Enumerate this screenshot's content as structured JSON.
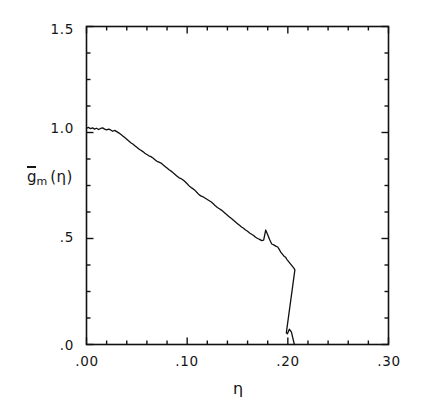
{
  "figure": {
    "background_color": "#ffffff",
    "line_color": "#111111",
    "axis_color": "#111111"
  },
  "axes": {
    "x_label": "η",
    "y_label_base": "g",
    "y_label_sub": "m",
    "y_label_arg": "(η)",
    "y_tick_labels": [
      "1.5",
      "1.0",
      ".5",
      ".0"
    ],
    "y_tick_values": [
      1.5,
      1.0,
      0.5,
      0.0
    ],
    "x_tick_labels": [
      ".00",
      ".10",
      ".20",
      ".30"
    ],
    "x_tick_values": [
      0.0,
      0.1,
      0.2,
      0.3
    ],
    "x_minor_count": 5,
    "y_minor_count": 3
  },
  "chart_data": {
    "type": "line",
    "title": "",
    "subtitle": "",
    "xlabel": "η",
    "ylabel": "ḡ_m (η)",
    "xlim": [
      0.0,
      0.3
    ],
    "ylim": [
      0.0,
      1.5
    ],
    "grid": false,
    "legend": null,
    "legend_position": "none",
    "xticks": [
      0.0,
      0.1,
      0.2,
      0.3
    ],
    "xticklabels": [
      ".00",
      ".10",
      ".20",
      ".30"
    ],
    "yticks": [
      0.0,
      0.5,
      1.0,
      1.5
    ],
    "yticklabels": [
      ".0",
      ".5",
      "1.0",
      "1.5"
    ],
    "series": [
      {
        "name": "g_m(eta)",
        "color": "#111111",
        "linewidth": 1.3,
        "x": [
          0.0,
          0.002,
          0.004,
          0.006,
          0.008,
          0.01,
          0.012,
          0.014,
          0.016,
          0.018,
          0.02,
          0.022,
          0.024,
          0.026,
          0.028,
          0.03,
          0.032,
          0.034,
          0.036,
          0.038,
          0.04,
          0.042,
          0.044,
          0.046,
          0.048,
          0.05,
          0.052,
          0.054,
          0.056,
          0.058,
          0.06,
          0.062,
          0.064,
          0.066,
          0.068,
          0.07,
          0.072,
          0.074,
          0.076,
          0.078,
          0.08,
          0.082,
          0.084,
          0.086,
          0.088,
          0.09,
          0.092,
          0.094,
          0.096,
          0.098,
          0.1,
          0.102,
          0.104,
          0.106,
          0.108,
          0.11,
          0.112,
          0.114,
          0.116,
          0.118,
          0.12,
          0.122,
          0.124,
          0.126,
          0.128,
          0.13,
          0.132,
          0.134,
          0.136,
          0.138,
          0.14,
          0.142,
          0.144,
          0.146,
          0.148,
          0.15,
          0.152,
          0.154,
          0.156,
          0.158,
          0.16,
          0.162,
          0.164,
          0.166,
          0.168,
          0.17,
          0.172,
          0.174,
          0.176,
          0.178,
          0.18,
          0.182,
          0.184,
          0.186,
          0.188,
          0.19,
          0.191,
          0.192,
          0.193,
          0.194,
          0.195,
          0.196,
          0.197,
          0.198,
          0.199,
          0.2,
          0.201,
          0.202,
          0.203,
          0.204,
          0.205,
          0.206,
          0.207
        ],
        "y": [
          1.02,
          1.024,
          1.018,
          1.022,
          1.016,
          1.02,
          1.014,
          1.019,
          1.022,
          1.016,
          1.012,
          1.016,
          1.012,
          1.006,
          1.01,
          1.004,
          0.998,
          0.992,
          0.984,
          0.976,
          0.968,
          0.96,
          0.952,
          0.946,
          0.938,
          0.93,
          0.922,
          0.916,
          0.91,
          0.902,
          0.896,
          0.89,
          0.886,
          0.88,
          0.872,
          0.864,
          0.86,
          0.856,
          0.848,
          0.84,
          0.832,
          0.824,
          0.818,
          0.81,
          0.802,
          0.794,
          0.786,
          0.782,
          0.776,
          0.768,
          0.758,
          0.748,
          0.74,
          0.734,
          0.726,
          0.716,
          0.706,
          0.7,
          0.696,
          0.69,
          0.684,
          0.678,
          0.672,
          0.664,
          0.654,
          0.646,
          0.64,
          0.634,
          0.626,
          0.618,
          0.61,
          0.602,
          0.594,
          0.586,
          0.578,
          0.57,
          0.562,
          0.554,
          0.548,
          0.54,
          0.534,
          0.526,
          0.52,
          0.514,
          0.506,
          0.5,
          0.496,
          0.49,
          0.492,
          0.54,
          0.518,
          0.494,
          0.474,
          0.47,
          0.464,
          0.46,
          0.452,
          0.444,
          0.436,
          0.43,
          0.424,
          0.418,
          0.414,
          0.41,
          0.402,
          0.396,
          0.39,
          0.384,
          0.378,
          0.372,
          0.366,
          0.36,
          0.352
        ],
        "note": "monotone decreasing noisy curve from ~1.02 at eta=0 to ~0.35, then sharp cliff to ~0 near eta=0.20"
      }
    ],
    "features": {
      "plateau_start_value": 1.02,
      "plateau_end_eta": 0.028,
      "local_spike_eta": 0.141,
      "local_spike_value": 0.545,
      "cliff_start_eta": 0.189,
      "cliff_start_value": 0.352,
      "cliff_end_eta": 0.1985,
      "cliff_end_value": 0.055,
      "shoulder_eta": 0.2015,
      "shoulder_value": 0.072,
      "terminus_eta": 0.2065,
      "terminus_value": 0.0
    }
  }
}
